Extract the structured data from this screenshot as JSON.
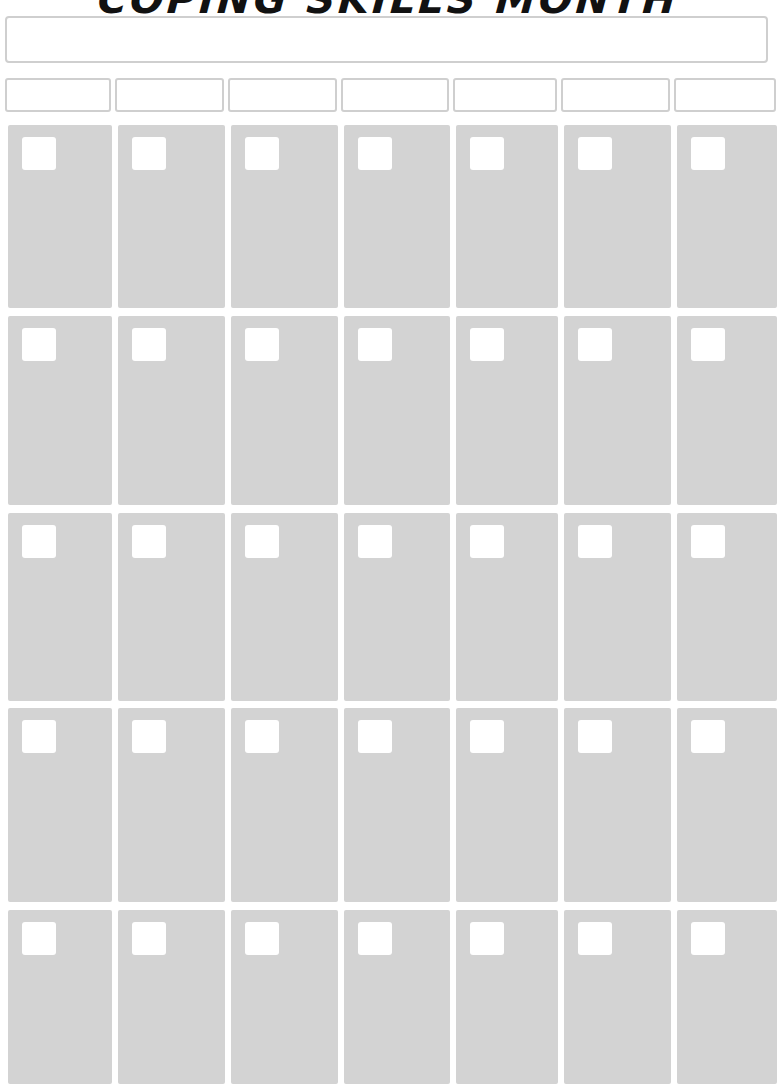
{
  "title": "COPING SKILLS MONTH",
  "month_field": {
    "value": ""
  },
  "weekday_headers": [
    "",
    "",
    "",
    "",
    "",
    "",
    ""
  ],
  "grid": {
    "rows": 5,
    "columns": 7,
    "cell_color": "#d3d3d3",
    "border_color": "#cfcfcf",
    "weeks": [
      [
        "",
        "",
        "",
        "",
        "",
        "",
        ""
      ],
      [
        "",
        "",
        "",
        "",
        "",
        "",
        ""
      ],
      [
        "",
        "",
        "",
        "",
        "",
        "",
        ""
      ],
      [
        "",
        "",
        "",
        "",
        "",
        "",
        ""
      ],
      [
        "",
        "",
        "",
        "",
        "",
        "",
        ""
      ]
    ]
  }
}
